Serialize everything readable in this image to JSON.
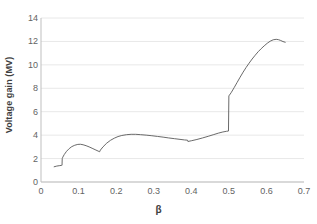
{
  "chart_data": {
    "type": "line",
    "title": "",
    "xlabel": "β",
    "ylabel": "Voltage gain (MV)",
    "xlim": [
      0,
      0.7
    ],
    "ylim": [
      0,
      14
    ],
    "xticks": [
      "0",
      "0.1",
      "0.2",
      "0.3",
      "0.4",
      "0.5",
      "0.6",
      "0.7"
    ],
    "xtick_values": [
      0,
      0.1,
      0.2,
      0.3,
      0.4,
      0.5,
      0.6,
      0.7
    ],
    "yticks": [
      "0",
      "2",
      "4",
      "6",
      "8",
      "10",
      "12",
      "14"
    ],
    "ytick_values": [
      0,
      2,
      4,
      6,
      8,
      10,
      12,
      14
    ],
    "grid": "horizontal",
    "grid_color": "#e8e8e8",
    "axis_color": "#bfbfbf",
    "line_color": "#595959",
    "line_width": 0.9,
    "legend": null,
    "series": [
      {
        "name": "Voltage gain",
        "points": [
          [
            0.035,
            1.3
          ],
          [
            0.042,
            1.36
          ],
          [
            0.05,
            1.4
          ],
          [
            0.055,
            1.42
          ],
          [
            0.056,
            1.43
          ],
          [
            0.0565,
            2.0
          ],
          [
            0.058,
            2.12
          ],
          [
            0.062,
            2.35
          ],
          [
            0.068,
            2.62
          ],
          [
            0.075,
            2.85
          ],
          [
            0.082,
            3.02
          ],
          [
            0.09,
            3.14
          ],
          [
            0.098,
            3.21
          ],
          [
            0.105,
            3.22
          ],
          [
            0.112,
            3.18
          ],
          [
            0.12,
            3.1
          ],
          [
            0.128,
            3.0
          ],
          [
            0.136,
            2.88
          ],
          [
            0.144,
            2.76
          ],
          [
            0.152,
            2.64
          ],
          [
            0.156,
            2.58
          ],
          [
            0.158,
            2.72
          ],
          [
            0.165,
            3.0
          ],
          [
            0.175,
            3.32
          ],
          [
            0.185,
            3.56
          ],
          [
            0.195,
            3.74
          ],
          [
            0.205,
            3.88
          ],
          [
            0.215,
            3.97
          ],
          [
            0.228,
            4.04
          ],
          [
            0.24,
            4.07
          ],
          [
            0.252,
            4.07
          ],
          [
            0.265,
            4.04
          ],
          [
            0.28,
            4.0
          ],
          [
            0.295,
            3.95
          ],
          [
            0.31,
            3.89
          ],
          [
            0.325,
            3.83
          ],
          [
            0.34,
            3.76
          ],
          [
            0.355,
            3.7
          ],
          [
            0.37,
            3.64
          ],
          [
            0.382,
            3.59
          ],
          [
            0.39,
            3.57
          ],
          [
            0.391,
            3.46
          ],
          [
            0.4,
            3.52
          ],
          [
            0.415,
            3.63
          ],
          [
            0.43,
            3.76
          ],
          [
            0.445,
            3.9
          ],
          [
            0.46,
            4.05
          ],
          [
            0.472,
            4.17
          ],
          [
            0.484,
            4.27
          ],
          [
            0.494,
            4.33
          ],
          [
            0.499,
            4.35
          ],
          [
            0.5,
            7.35
          ],
          [
            0.506,
            7.62
          ],
          [
            0.514,
            8.05
          ],
          [
            0.522,
            8.5
          ],
          [
            0.53,
            8.95
          ],
          [
            0.538,
            9.38
          ],
          [
            0.546,
            9.78
          ],
          [
            0.554,
            10.15
          ],
          [
            0.562,
            10.5
          ],
          [
            0.57,
            10.82
          ],
          [
            0.578,
            11.12
          ],
          [
            0.586,
            11.38
          ],
          [
            0.594,
            11.62
          ],
          [
            0.602,
            11.84
          ],
          [
            0.61,
            12.02
          ],
          [
            0.618,
            12.14
          ],
          [
            0.626,
            12.18
          ],
          [
            0.632,
            12.15
          ],
          [
            0.638,
            12.08
          ],
          [
            0.644,
            11.99
          ],
          [
            0.65,
            11.93
          ]
        ]
      }
    ]
  }
}
